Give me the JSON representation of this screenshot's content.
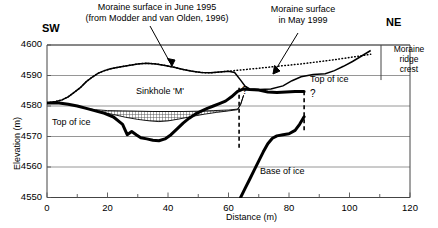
{
  "chart_data": {
    "type": "line",
    "title": "",
    "xlabel": "Distance (m)",
    "ylabel": "Elevation (m)",
    "xlim": [
      0,
      120
    ],
    "ylim": [
      4550,
      4600
    ],
    "xticks": [
      0,
      20,
      40,
      60,
      80,
      100,
      120
    ],
    "xticklabels": [
      "0",
      "20",
      "40",
      "60",
      "80",
      "100",
      "120"
    ],
    "xminorticks": [
      10,
      30,
      50,
      70,
      90,
      110
    ],
    "yticks": [
      4550,
      4560,
      4570,
      4580,
      4590,
      4600
    ],
    "yticklabels": [
      "4550",
      "4560",
      "4570",
      "4580",
      "4590",
      "4600"
    ],
    "grid": "horizontal",
    "legend_position": "annotations",
    "series": [
      {
        "name": "Moraine surface in June 1995",
        "style": "dotted",
        "points": [
          [
            0,
            4581
          ],
          [
            3,
            4581.5
          ],
          [
            5,
            4582
          ],
          [
            7,
            4583
          ],
          [
            9,
            4584.5
          ],
          [
            11,
            4586
          ],
          [
            13,
            4588
          ],
          [
            15,
            4589.5
          ],
          [
            17,
            4590.8
          ],
          [
            19,
            4591.6
          ],
          [
            21,
            4592.2
          ],
          [
            24,
            4592.8
          ],
          [
            27,
            4593.3
          ],
          [
            30,
            4593.8
          ],
          [
            33,
            4594.0
          ],
          [
            36,
            4593.8
          ],
          [
            39,
            4593.3
          ],
          [
            42,
            4592.7
          ],
          [
            45,
            4592.0
          ],
          [
            48,
            4591.4
          ],
          [
            51,
            4591.0
          ],
          [
            54,
            4590.9
          ],
          [
            57,
            4591.1
          ],
          [
            60,
            4591.4
          ],
          [
            64,
            4591.8
          ],
          [
            68,
            4592.2
          ],
          [
            72,
            4592.6
          ],
          [
            76,
            4593.0
          ],
          [
            80,
            4593.4
          ],
          [
            84,
            4593.8
          ],
          [
            88,
            4594.3
          ],
          [
            92,
            4594.8
          ],
          [
            96,
            4595.3
          ],
          [
            100,
            4595.9
          ],
          [
            104,
            4596.5
          ],
          [
            107,
            4597.0
          ]
        ]
      },
      {
        "name": "Moraine surface in May 1999",
        "style": "solid",
        "points": [
          [
            0,
            4581
          ],
          [
            3,
            4581.5
          ],
          [
            5,
            4582
          ],
          [
            7,
            4583
          ],
          [
            9,
            4584.5
          ],
          [
            11,
            4586
          ],
          [
            13,
            4588
          ],
          [
            15,
            4589.5
          ],
          [
            17,
            4590.8
          ],
          [
            19,
            4591.6
          ],
          [
            21,
            4592.2
          ],
          [
            24,
            4592.8
          ],
          [
            27,
            4593.3
          ],
          [
            30,
            4593.8
          ],
          [
            33,
            4594.0
          ],
          [
            36,
            4593.8
          ],
          [
            39,
            4593.3
          ],
          [
            42,
            4592.7
          ],
          [
            45,
            4592.0
          ],
          [
            48,
            4591.4
          ],
          [
            51,
            4591.0
          ],
          [
            54,
            4590.9
          ],
          [
            57,
            4591.1
          ],
          [
            60,
            4591.4
          ],
          [
            62,
            4591.0
          ],
          [
            64,
            4588.5
          ],
          [
            65.5,
            4586.5
          ],
          [
            67,
            4585.6
          ],
          [
            70,
            4585.4
          ],
          [
            74,
            4585.6
          ],
          [
            78,
            4586.6
          ],
          [
            81,
            4588.3
          ],
          [
            84,
            4589.6
          ],
          [
            88,
            4590.3
          ],
          [
            92,
            4590.6
          ],
          [
            95,
            4591.6
          ],
          [
            98,
            4593.0
          ],
          [
            101,
            4594.6
          ],
          [
            104,
            4596.4
          ],
          [
            107,
            4598.2
          ]
        ]
      },
      {
        "name": "Top of ice",
        "style": "thick-solid",
        "points": [
          [
            0,
            4581
          ],
          [
            4,
            4581
          ],
          [
            7,
            4580.6
          ],
          [
            10,
            4580.0
          ],
          [
            13,
            4579.2
          ],
          [
            16,
            4578.4
          ],
          [
            19,
            4577.6
          ],
          [
            22,
            4576.4
          ],
          [
            25,
            4574.0
          ],
          [
            26.5,
            4570.6
          ],
          [
            28,
            4571.6
          ],
          [
            29.5,
            4570.6
          ],
          [
            31,
            4569.6
          ],
          [
            33,
            4569.2
          ],
          [
            35,
            4568.8
          ],
          [
            37,
            4568.6
          ],
          [
            39,
            4569.2
          ],
          [
            41,
            4570.6
          ],
          [
            43,
            4572.5
          ],
          [
            45,
            4574.4
          ],
          [
            47,
            4576.0
          ],
          [
            49,
            4577.3
          ],
          [
            51,
            4578.3
          ],
          [
            53,
            4579.2
          ],
          [
            55,
            4580.0
          ],
          [
            57,
            4580.8
          ],
          [
            59,
            4581.6
          ],
          [
            61,
            4583.0
          ],
          [
            63,
            4584.8
          ],
          [
            65,
            4585.6
          ],
          [
            67,
            4585.4
          ],
          [
            70,
            4585.2
          ],
          [
            73,
            4584.6
          ],
          [
            76,
            4584.4
          ],
          [
            79,
            4584.6
          ],
          [
            82,
            4584.8
          ],
          [
            85,
            4584.8
          ]
        ]
      },
      {
        "name": "Base of ice",
        "style": "thick-solid",
        "points": [
          [
            64,
            4550
          ],
          [
            65.5,
            4553
          ],
          [
            67,
            4556
          ],
          [
            68.5,
            4559
          ],
          [
            70,
            4562
          ],
          [
            71.5,
            4565
          ],
          [
            73,
            4567.6
          ],
          [
            74.5,
            4569.4
          ],
          [
            76,
            4570.2
          ],
          [
            78,
            4570.6
          ],
          [
            80,
            4570.9
          ],
          [
            82,
            4572.0
          ],
          [
            83.5,
            4574.0
          ],
          [
            85,
            4576.5
          ]
        ]
      },
      {
        "name": "Sinkhole fill upper boundary",
        "style": "thin-solid",
        "points": [
          [
            10,
            4580.0
          ],
          [
            13,
            4579.2
          ],
          [
            16,
            4578.8
          ],
          [
            20,
            4578.5
          ],
          [
            25,
            4578.4
          ],
          [
            30,
            4578.3
          ],
          [
            35,
            4578.2
          ],
          [
            40,
            4578.2
          ],
          [
            45,
            4578.2
          ],
          [
            50,
            4578.3
          ],
          [
            55,
            4578.5
          ],
          [
            60,
            4578.7
          ],
          [
            63,
            4579.0
          ],
          [
            64,
            4580.5
          ],
          [
            65,
            4583.5
          ]
        ]
      },
      {
        "name": "Sinkhole fill lower boundary",
        "style": "thin-solid",
        "points": [
          [
            10,
            4580.0
          ],
          [
            14,
            4578.9
          ],
          [
            18,
            4578.0
          ],
          [
            22,
            4577.2
          ],
          [
            26,
            4576.3
          ],
          [
            30,
            4575.6
          ],
          [
            34,
            4575.1
          ],
          [
            37,
            4574.9
          ],
          [
            40,
            4575.1
          ],
          [
            44,
            4575.8
          ],
          [
            48,
            4576.6
          ],
          [
            52,
            4577.3
          ],
          [
            56,
            4577.9
          ],
          [
            60,
            4578.4
          ],
          [
            63,
            4578.8
          ],
          [
            64,
            4580.5
          ],
          [
            65,
            4583.5
          ]
        ]
      }
    ],
    "uncertain_boundaries": [
      {
        "name": "left-ice-edge",
        "x": 63.5,
        "y_top": 4586.0,
        "y_bottom": 4566.0,
        "style": "dashed"
      },
      {
        "name": "right-ice-edge",
        "x": 85.0,
        "y_top": 4584.8,
        "y_bottom": 4572.0,
        "style": "dashed"
      }
    ],
    "annotations": [
      {
        "name": "moraine-1995-label",
        "text_lines": [
          "Moraine surface in June 1995",
          "(from Modder and van Olden, 1996)"
        ],
        "x": 0.4,
        "y": 0.055
      },
      {
        "name": "moraine-1999-label",
        "text_lines": [
          "Moraine surface",
          "in May 1999"
        ],
        "x": 0.74,
        "y": 0.045
      },
      {
        "name": "sinkhole-label",
        "text": "Sinkhole 'M'",
        "x": 32,
        "y": 4583.5
      },
      {
        "name": "top-of-ice-left-label",
        "text": "Top of ice",
        "x": 6,
        "y": 4573.6
      },
      {
        "name": "top-of-ice-right-label",
        "text": "Top of ice",
        "x": 86,
        "y": 4584.6
      },
      {
        "name": "base-of-ice-label",
        "text": "Base of ice",
        "x": 72,
        "y": 4559
      },
      {
        "name": "question-mark-left",
        "text": "?",
        "x": 66,
        "y": 4580.5
      },
      {
        "name": "question-mark-right",
        "text": "?",
        "x": 86,
        "y": 4579.5
      },
      {
        "name": "moraine-ridge-crest-label",
        "text_lines": [
          "Moraine",
          "ridge",
          "crest"
        ],
        "x": 113,
        "y": 4595
      }
    ],
    "direction_labels": {
      "left": "SW",
      "right": "NE"
    }
  },
  "figure": {
    "axis_title_x": "Distance (m)",
    "axis_title_y": "Elevation (m)"
  }
}
